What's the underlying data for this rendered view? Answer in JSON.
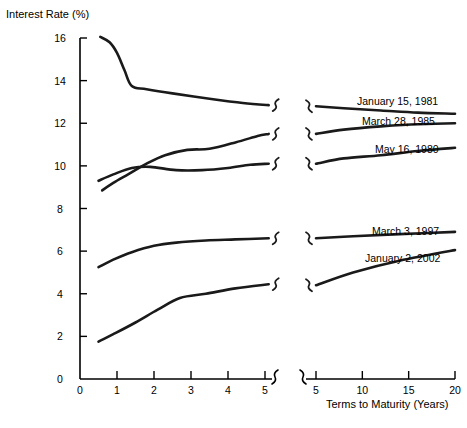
{
  "chart_data": {
    "type": "line",
    "title": "",
    "ylabel": "Interest Rate (%)",
    "xlabel": "Terms to Maturity (Years)",
    "ylim": [
      0,
      16
    ],
    "y_ticks": [
      0,
      2,
      4,
      6,
      8,
      10,
      12,
      14,
      16
    ],
    "grid": false,
    "legend_position": "inline-right-of-curve",
    "axis_break": true,
    "x_axis_segments": [
      {
        "name": "left",
        "xlim": [
          0,
          5
        ],
        "ticks": [
          0,
          1,
          2,
          3,
          4,
          5
        ]
      },
      {
        "name": "right",
        "xlim": [
          5,
          20
        ],
        "ticks": [
          5,
          10,
          15,
          20
        ]
      }
    ],
    "series": [
      {
        "name": "January 15, 1981",
        "points_left": [
          {
            "x": 0.55,
            "y": 16.05
          },
          {
            "x": 0.8,
            "y": 15.8
          },
          {
            "x": 1.0,
            "y": 15.3
          },
          {
            "x": 1.2,
            "y": 14.5
          },
          {
            "x": 1.4,
            "y": 13.75
          },
          {
            "x": 1.8,
            "y": 13.6
          },
          {
            "x": 2.5,
            "y": 13.4
          },
          {
            "x": 3.5,
            "y": 13.15
          },
          {
            "x": 4.4,
            "y": 12.95
          },
          {
            "x": 5.1,
            "y": 12.85
          }
        ],
        "points_right": [
          {
            "x": 5.0,
            "y": 12.8
          },
          {
            "x": 8.0,
            "y": 12.7
          },
          {
            "x": 12.0,
            "y": 12.6
          },
          {
            "x": 16.0,
            "y": 12.5
          },
          {
            "x": 20.0,
            "y": 12.45
          }
        ]
      },
      {
        "name": "March 28, 1985",
        "points_left": [
          {
            "x": 0.6,
            "y": 8.85
          },
          {
            "x": 0.9,
            "y": 9.2
          },
          {
            "x": 1.3,
            "y": 9.6
          },
          {
            "x": 1.8,
            "y": 10.1
          },
          {
            "x": 2.3,
            "y": 10.5
          },
          {
            "x": 2.9,
            "y": 10.75
          },
          {
            "x": 3.5,
            "y": 10.8
          },
          {
            "x": 4.2,
            "y": 11.1
          },
          {
            "x": 4.8,
            "y": 11.4
          },
          {
            "x": 5.1,
            "y": 11.5
          }
        ],
        "points_right": [
          {
            "x": 5.0,
            "y": 11.5
          },
          {
            "x": 8.0,
            "y": 11.7
          },
          {
            "x": 12.0,
            "y": 11.85
          },
          {
            "x": 16.0,
            "y": 11.95
          },
          {
            "x": 20.0,
            "y": 12.0
          }
        ]
      },
      {
        "name": "May 16, 1980",
        "points_left": [
          {
            "x": 0.5,
            "y": 9.3
          },
          {
            "x": 0.9,
            "y": 9.6
          },
          {
            "x": 1.4,
            "y": 9.9
          },
          {
            "x": 1.9,
            "y": 9.95
          },
          {
            "x": 2.6,
            "y": 9.8
          },
          {
            "x": 3.3,
            "y": 9.8
          },
          {
            "x": 4.0,
            "y": 9.9
          },
          {
            "x": 4.6,
            "y": 10.05
          },
          {
            "x": 5.1,
            "y": 10.1
          }
        ],
        "points_right": [
          {
            "x": 5.0,
            "y": 10.1
          },
          {
            "x": 8.0,
            "y": 10.35
          },
          {
            "x": 12.0,
            "y": 10.5
          },
          {
            "x": 16.0,
            "y": 10.7
          },
          {
            "x": 20.0,
            "y": 10.85
          }
        ]
      },
      {
        "name": "March 3, 1997",
        "points_left": [
          {
            "x": 0.5,
            "y": 5.25
          },
          {
            "x": 0.9,
            "y": 5.6
          },
          {
            "x": 1.4,
            "y": 5.95
          },
          {
            "x": 2.0,
            "y": 6.25
          },
          {
            "x": 2.6,
            "y": 6.4
          },
          {
            "x": 3.4,
            "y": 6.5
          },
          {
            "x": 4.2,
            "y": 6.55
          },
          {
            "x": 5.1,
            "y": 6.6
          }
        ],
        "points_right": [
          {
            "x": 5.0,
            "y": 6.6
          },
          {
            "x": 9.0,
            "y": 6.7
          },
          {
            "x": 14.0,
            "y": 6.8
          },
          {
            "x": 20.0,
            "y": 6.9
          }
        ]
      },
      {
        "name": "January 2, 2002",
        "points_left": [
          {
            "x": 0.5,
            "y": 1.75
          },
          {
            "x": 0.9,
            "y": 2.1
          },
          {
            "x": 1.5,
            "y": 2.65
          },
          {
            "x": 2.1,
            "y": 3.25
          },
          {
            "x": 2.7,
            "y": 3.8
          },
          {
            "x": 3.4,
            "y": 4.0
          },
          {
            "x": 4.2,
            "y": 4.25
          },
          {
            "x": 5.1,
            "y": 4.45
          }
        ],
        "points_right": [
          {
            "x": 5.0,
            "y": 4.4
          },
          {
            "x": 9.0,
            "y": 5.0
          },
          {
            "x": 14.0,
            "y": 5.55
          },
          {
            "x": 20.0,
            "y": 6.05
          }
        ]
      }
    ]
  },
  "axes": {
    "y_title": "Interest Rate (%)",
    "x_title": "Terms to Maturity (Years)",
    "y_tick_labels": [
      "0",
      "2",
      "4",
      "6",
      "8",
      "10",
      "12",
      "14",
      "16"
    ],
    "x_tick_labels_left": [
      "0",
      "1",
      "2",
      "3",
      "4",
      "5"
    ],
    "x_tick_labels_right": [
      "5",
      "10",
      "15",
      "20"
    ]
  },
  "labels": {
    "s1": "January 15, 1981",
    "s2": "March 28, 1985",
    "s3": "May 16, 1980",
    "s4": "March 3, 1997",
    "s5": "January 2, 2002"
  },
  "colors": {
    "line": "#1a1a1a",
    "axis": "#000000",
    "background": "#ffffff"
  }
}
